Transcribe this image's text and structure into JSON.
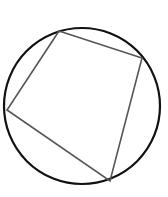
{
  "diagram": {
    "type": "inscribed-quadrilateral",
    "canvas": {
      "width": 168,
      "height": 197
    },
    "circle": {
      "cx": 82,
      "cy": 106,
      "r": 78,
      "stroke": "#111111",
      "stroke_width": 2.2
    },
    "quadrilateral": {
      "vertices": [
        {
          "name": "top",
          "x": 59,
          "y": 31
        },
        {
          "name": "right",
          "x": 142,
          "y": 58
        },
        {
          "name": "bottom",
          "x": 110,
          "y": 181
        },
        {
          "name": "left",
          "x": 7,
          "y": 110
        }
      ],
      "points": "59,31 142,58 110,181 7,110",
      "stroke": "#555555",
      "stroke_width": 1.6
    }
  }
}
